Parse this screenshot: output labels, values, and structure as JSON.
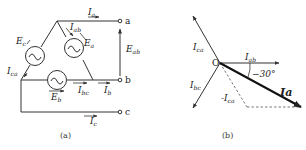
{
  "figure_a": {
    "caption": "(a)",
    "terminals": [
      "a",
      "b",
      "c"
    ],
    "sources": [
      {
        "name": "E_c",
        "label": "E",
        "sub": "c"
      },
      {
        "name": "E_a",
        "label": "E",
        "sub": "a"
      },
      {
        "name": "E_b",
        "label": "E",
        "sub": "b"
      }
    ],
    "currents": {
      "Ia": {
        "label": "I",
        "sub": "a"
      },
      "Iab": {
        "label": "I",
        "sub": "ab"
      },
      "Ica": {
        "label": "I",
        "sub": "ca"
      },
      "Ibc": {
        "label": "I",
        "sub": "bc"
      },
      "Ib": {
        "label": "I",
        "sub": "b"
      },
      "Ic": {
        "label": "I",
        "sub": "c"
      }
    },
    "voltage": {
      "label": "E",
      "sub": "ab"
    }
  },
  "figure_b": {
    "caption": "(b)",
    "origin": "O",
    "angle": "−30°",
    "phasors": {
      "Ica": {
        "label": "I",
        "sub": "ca"
      },
      "Iab": {
        "label": "I",
        "sub": "ab"
      },
      "Ibc": {
        "label": "I",
        "sub": "bc"
      },
      "negIca": {
        "label": "-I",
        "sub": "ca"
      },
      "Ia": {
        "label": "Ia"
      }
    }
  }
}
